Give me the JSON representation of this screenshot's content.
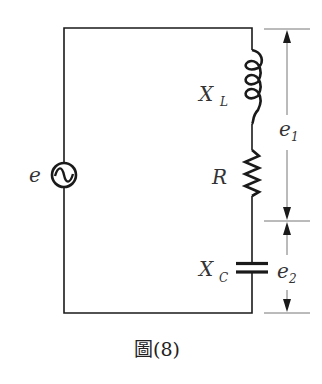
{
  "diagram": {
    "type": "circuit",
    "caption": "圖(8)",
    "source": {
      "label": "e",
      "symbol": "ac-source"
    },
    "components": [
      {
        "id": "inductor",
        "symbol": "X",
        "subscript": "L"
      },
      {
        "id": "resistor",
        "symbol": "R",
        "subscript": ""
      },
      {
        "id": "capacitor",
        "symbol": "X",
        "subscript": "C"
      }
    ],
    "voltages": [
      {
        "id": "e1",
        "symbol": "e",
        "subscript": "1",
        "spans": [
          "inductor",
          "resistor"
        ]
      },
      {
        "id": "e2",
        "symbol": "e",
        "subscript": "2",
        "spans": [
          "capacitor"
        ]
      }
    ],
    "colors": {
      "wire": "#1a1a1a",
      "dimension": "#555555",
      "text": "#333333"
    }
  }
}
